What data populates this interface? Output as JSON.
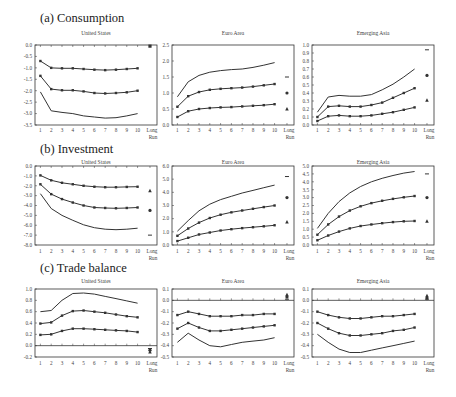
{
  "figure": {
    "x_ticks": [
      "1",
      "2",
      "3",
      "4",
      "5",
      "6",
      "7",
      "8",
      "9",
      "10"
    ],
    "long_run_label": [
      "Long",
      "Run"
    ],
    "colors": {
      "line": "#333333",
      "frame": "#333333",
      "text": "#444444"
    }
  },
  "chart_data": [
    {
      "section": "(a) Consumption",
      "panels": [
        {
          "title": "United States",
          "type": "line",
          "ylim": [
            -3.5,
            0.0
          ],
          "yticks": [
            "0.0",
            "-0.5",
            "-1.0",
            "-1.5",
            "-2.0",
            "-2.5",
            "-3.0",
            "-3.5"
          ],
          "ytick_vals": [
            0,
            -0.5,
            -1,
            -1.5,
            -2,
            -2.5,
            -3,
            -3.5
          ],
          "zero_line": false,
          "x": [
            1,
            2,
            3,
            4,
            5,
            6,
            7,
            8,
            9,
            10
          ],
          "series": [
            {
              "name": "upper (triangle)",
              "marker": true,
              "values": [
                -0.7,
                -1.0,
                -1.02,
                -1.02,
                -1.05,
                -1.08,
                -1.1,
                -1.08,
                -1.05,
                -1.02
              ],
              "long_run": -0.05,
              "long_run_marker": "square"
            },
            {
              "name": "middle (star)",
              "marker": true,
              "values": [
                -1.35,
                -1.93,
                -1.98,
                -1.98,
                -2.03,
                -2.1,
                -2.12,
                -2.1,
                -2.07,
                -2.0
              ],
              "long_run": null
            },
            {
              "name": "lower (dash)",
              "marker": false,
              "values": [
                -2.05,
                -2.88,
                -2.95,
                -3.0,
                -3.1,
                -3.15,
                -3.2,
                -3.18,
                -3.1,
                -3.0
              ],
              "long_run": null
            }
          ]
        },
        {
          "title": "Euro Area",
          "type": "line",
          "ylim": [
            0.0,
            2.5
          ],
          "yticks": [
            "2.5",
            "2.0",
            "1.5",
            "1.0",
            "0.5",
            "0.0"
          ],
          "ytick_vals": [
            2.5,
            2,
            1.5,
            1,
            0.5,
            0
          ],
          "zero_line": false,
          "x": [
            1,
            2,
            3,
            4,
            5,
            6,
            7,
            8,
            9,
            10
          ],
          "series": [
            {
              "name": "upper (dash)",
              "marker": false,
              "values": [
                0.88,
                1.35,
                1.55,
                1.65,
                1.7,
                1.73,
                1.75,
                1.8,
                1.87,
                1.95
              ],
              "long_run": 1.5,
              "long_run_marker": "dash"
            },
            {
              "name": "middle (star)",
              "marker": true,
              "values": [
                0.57,
                0.9,
                1.03,
                1.1,
                1.13,
                1.15,
                1.17,
                1.2,
                1.24,
                1.28
              ],
              "long_run": 1.0,
              "long_run_marker": "star"
            },
            {
              "name": "lower (triangle)",
              "marker": true,
              "values": [
                0.25,
                0.43,
                0.5,
                0.53,
                0.55,
                0.56,
                0.58,
                0.6,
                0.62,
                0.65
              ],
              "long_run": 0.5,
              "long_run_marker": "triangle"
            }
          ]
        },
        {
          "title": "Emerging Asia",
          "type": "line",
          "ylim": [
            0.0,
            1.0
          ],
          "yticks": [
            "1.0",
            "0.9",
            "0.8",
            "0.7",
            "0.6",
            "0.5",
            "0.4",
            "0.3",
            "0.2",
            "0.1",
            "0.0"
          ],
          "ytick_vals": [
            1,
            0.9,
            0.8,
            0.7,
            0.6,
            0.5,
            0.4,
            0.3,
            0.2,
            0.1,
            0
          ],
          "zero_line": false,
          "x": [
            1,
            2,
            3,
            4,
            5,
            6,
            7,
            8,
            9,
            10
          ],
          "series": [
            {
              "name": "upper (dash)",
              "marker": false,
              "values": [
                0.16,
                0.35,
                0.37,
                0.36,
                0.36,
                0.38,
                0.44,
                0.51,
                0.6,
                0.7
              ],
              "long_run": 0.94,
              "long_run_marker": "dash"
            },
            {
              "name": "middle (star)",
              "marker": true,
              "values": [
                0.1,
                0.23,
                0.24,
                0.23,
                0.23,
                0.25,
                0.28,
                0.34,
                0.4,
                0.46
              ],
              "long_run": 0.62,
              "long_run_marker": "star"
            },
            {
              "name": "lower (triangle)",
              "marker": true,
              "values": [
                0.05,
                0.11,
                0.12,
                0.11,
                0.11,
                0.12,
                0.14,
                0.16,
                0.19,
                0.22
              ],
              "long_run": 0.31,
              "long_run_marker": "triangle"
            }
          ]
        }
      ]
    },
    {
      "section": "(b) Investment",
      "panels": [
        {
          "title": "United States",
          "type": "line",
          "ylim": [
            -8.0,
            0.0
          ],
          "yticks": [
            "0.0",
            "-1.0",
            "-2.0",
            "-3.0",
            "-4.0",
            "-5.0",
            "-6.0",
            "-7.0",
            "-8.0"
          ],
          "ytick_vals": [
            0,
            -1,
            -2,
            -3,
            -4,
            -5,
            -6,
            -7,
            -8
          ],
          "zero_line": false,
          "x": [
            1,
            2,
            3,
            4,
            5,
            6,
            7,
            8,
            9,
            10
          ],
          "series": [
            {
              "name": "upper (triangle)",
              "marker": true,
              "values": [
                -0.95,
                -1.45,
                -1.7,
                -1.85,
                -2.0,
                -2.1,
                -2.15,
                -2.15,
                -2.12,
                -2.1
              ],
              "long_run": -2.5,
              "long_run_marker": "triangle"
            },
            {
              "name": "middle (star)",
              "marker": true,
              "values": [
                -1.85,
                -2.85,
                -3.35,
                -3.7,
                -4.0,
                -4.2,
                -4.25,
                -4.28,
                -4.25,
                -4.2
              ],
              "long_run": -4.5,
              "long_run_marker": "star"
            },
            {
              "name": "lower (dash)",
              "marker": false,
              "values": [
                -2.8,
                -4.3,
                -5.0,
                -5.5,
                -5.95,
                -6.25,
                -6.4,
                -6.45,
                -6.4,
                -6.3
              ],
              "long_run": -7.0,
              "long_run_marker": "dash"
            }
          ]
        },
        {
          "title": "Euro Area",
          "type": "line",
          "ylim": [
            0.0,
            6.0
          ],
          "yticks": [
            "6.0",
            "5.0",
            "4.0",
            "3.0",
            "2.0",
            "1.0",
            "0.0"
          ],
          "ytick_vals": [
            6,
            5,
            4,
            3,
            2,
            1,
            0
          ],
          "zero_line": false,
          "x": [
            1,
            2,
            3,
            4,
            5,
            6,
            7,
            8,
            9,
            10
          ],
          "series": [
            {
              "name": "upper (dash)",
              "marker": false,
              "values": [
                1.05,
                1.85,
                2.6,
                3.1,
                3.45,
                3.7,
                3.95,
                4.15,
                4.35,
                4.55
              ],
              "long_run": 5.2,
              "long_run_marker": "dash"
            },
            {
              "name": "middle (star)",
              "marker": true,
              "values": [
                0.7,
                1.25,
                1.7,
                2.05,
                2.3,
                2.48,
                2.62,
                2.75,
                2.88,
                3.0
              ],
              "long_run": 3.6,
              "long_run_marker": "star"
            },
            {
              "name": "lower (triangle)",
              "marker": true,
              "values": [
                0.3,
                0.55,
                0.8,
                0.95,
                1.1,
                1.2,
                1.28,
                1.35,
                1.42,
                1.5
              ],
              "long_run": 1.75,
              "long_run_marker": "triangle"
            }
          ]
        },
        {
          "title": "Emerging Asia",
          "type": "line",
          "ylim": [
            0.0,
            5.0
          ],
          "yticks": [
            "5.0",
            "4.5",
            "4.0",
            "3.5",
            "3.0",
            "2.5",
            "2.0",
            "1.5",
            "1.0",
            "0.5",
            "0.0"
          ],
          "ytick_vals": [
            5,
            4.5,
            4,
            3.5,
            3,
            2.5,
            2,
            1.5,
            1,
            0.5,
            0
          ],
          "zero_line": false,
          "x": [
            1,
            2,
            3,
            4,
            5,
            6,
            7,
            8,
            9,
            10
          ],
          "series": [
            {
              "name": "upper (dash)",
              "marker": false,
              "values": [
                1.05,
                2.0,
                2.75,
                3.3,
                3.7,
                4.0,
                4.22,
                4.4,
                4.55,
                4.65
              ],
              "long_run": 4.5,
              "long_run_marker": "dash"
            },
            {
              "name": "middle (star)",
              "marker": true,
              "values": [
                0.65,
                1.3,
                1.8,
                2.18,
                2.45,
                2.65,
                2.8,
                2.92,
                3.02,
                3.1
              ],
              "long_run": 3.0,
              "long_run_marker": "star"
            },
            {
              "name": "lower (triangle)",
              "marker": true,
              "values": [
                0.3,
                0.6,
                0.85,
                1.05,
                1.2,
                1.3,
                1.38,
                1.45,
                1.5,
                1.52
              ],
              "long_run": 1.5,
              "long_run_marker": "triangle"
            }
          ]
        }
      ]
    },
    {
      "section": "(c) Trade balance",
      "panels": [
        {
          "title": "United States",
          "type": "line",
          "ylim": [
            -0.2,
            1.0
          ],
          "yticks": [
            "1.0",
            "0.8",
            "0.6",
            "0.4",
            "0.2",
            "0.0",
            "-0.2"
          ],
          "ytick_vals": [
            1,
            0.8,
            0.6,
            0.4,
            0.2,
            0,
            -0.2
          ],
          "zero_line": true,
          "x": [
            1,
            2,
            3,
            4,
            5,
            6,
            7,
            8,
            9,
            10
          ],
          "series": [
            {
              "name": "upper (dash)",
              "marker": false,
              "values": [
                0.6,
                0.62,
                0.8,
                0.92,
                0.93,
                0.91,
                0.87,
                0.83,
                0.79,
                0.75
              ],
              "long_run": -0.05,
              "long_run_marker": "dash"
            },
            {
              "name": "middle (star)",
              "marker": true,
              "values": [
                0.39,
                0.41,
                0.53,
                0.61,
                0.62,
                0.6,
                0.58,
                0.55,
                0.52,
                0.5
              ],
              "long_run": -0.08,
              "long_run_marker": "star"
            },
            {
              "name": "lower (triangle)",
              "marker": true,
              "values": [
                0.19,
                0.2,
                0.26,
                0.3,
                0.3,
                0.29,
                0.28,
                0.27,
                0.26,
                0.24
              ],
              "long_run": -0.11,
              "long_run_marker": "triangle"
            }
          ]
        },
        {
          "title": "Euro Area",
          "type": "line",
          "ylim": [
            -0.5,
            0.1
          ],
          "yticks": [
            "0.1",
            "0.0",
            "-0.1",
            "-0.2",
            "-0.3",
            "-0.4",
            "-0.5"
          ],
          "ytick_vals": [
            0.1,
            0,
            -0.1,
            -0.2,
            -0.3,
            -0.4,
            -0.5
          ],
          "zero_line": true,
          "x": [
            1,
            2,
            3,
            4,
            5,
            6,
            7,
            8,
            9,
            10
          ],
          "series": [
            {
              "name": "upper (triangle)",
              "marker": true,
              "values": [
                -0.13,
                -0.1,
                -0.12,
                -0.14,
                -0.14,
                -0.14,
                -0.13,
                -0.13,
                -0.12,
                -0.12
              ],
              "long_run": 0.05,
              "long_run_marker": "triangle"
            },
            {
              "name": "middle (star)",
              "marker": true,
              "values": [
                -0.25,
                -0.2,
                -0.24,
                -0.27,
                -0.27,
                -0.26,
                -0.25,
                -0.24,
                -0.23,
                -0.22
              ],
              "long_run": 0.03,
              "long_run_marker": "star"
            },
            {
              "name": "lower (dash)",
              "marker": false,
              "values": [
                -0.37,
                -0.29,
                -0.35,
                -0.4,
                -0.41,
                -0.39,
                -0.37,
                -0.36,
                -0.35,
                -0.33
              ],
              "long_run": 0.01,
              "long_run_marker": "dash"
            }
          ]
        },
        {
          "title": "Emerging Asia",
          "type": "line",
          "ylim": [
            -0.5,
            0.1
          ],
          "yticks": [
            "0.1",
            "0.0",
            "-0.1",
            "-0.2",
            "-0.3",
            "-0.4",
            "-0.5"
          ],
          "ytick_vals": [
            0.1,
            0,
            -0.1,
            -0.2,
            -0.3,
            -0.4,
            -0.5
          ],
          "zero_line": true,
          "x": [
            1,
            2,
            3,
            4,
            5,
            6,
            7,
            8,
            9,
            10
          ],
          "series": [
            {
              "name": "upper (triangle)",
              "marker": true,
              "values": [
                -0.1,
                -0.13,
                -0.15,
                -0.16,
                -0.16,
                -0.15,
                -0.14,
                -0.14,
                -0.13,
                -0.12
              ],
              "long_run": 0.04,
              "long_run_marker": "triangle"
            },
            {
              "name": "middle (star)",
              "marker": true,
              "values": [
                -0.2,
                -0.25,
                -0.29,
                -0.31,
                -0.31,
                -0.3,
                -0.29,
                -0.27,
                -0.26,
                -0.24
              ],
              "long_run": 0.02,
              "long_run_marker": "star"
            },
            {
              "name": "lower (dash)",
              "marker": false,
              "values": [
                -0.3,
                -0.37,
                -0.43,
                -0.46,
                -0.46,
                -0.44,
                -0.42,
                -0.4,
                -0.38,
                -0.36
              ],
              "long_run": 0.01,
              "long_run_marker": "dash"
            }
          ]
        }
      ]
    }
  ]
}
